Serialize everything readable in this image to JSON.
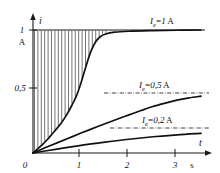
{
  "figure": {
    "name": "transient-current-curves",
    "background": "#ffffff",
    "ink_color": "#111111"
  },
  "axes": {
    "y": {
      "label": "i",
      "unit": "A",
      "ticks": [
        {
          "value": 1,
          "label": "1"
        },
        {
          "value": 0.5,
          "label": "0,5"
        }
      ],
      "origin_label": "0",
      "range": [
        0,
        1.12
      ]
    },
    "x": {
      "label": "t",
      "unit": "s",
      "ticks": [
        {
          "value": 1,
          "label": "1"
        },
        {
          "value": 2,
          "label": "2"
        },
        {
          "value": 3,
          "label": "3"
        }
      ],
      "range": [
        0,
        3.6
      ]
    }
  },
  "series_labels": {
    "top": {
      "symbol": "I",
      "subscript": "e",
      "equals": "=",
      "value": "1",
      "unit": "A"
    },
    "middle": {
      "symbol": "I",
      "subscript": "e",
      "equals": "=",
      "value": "0,5",
      "unit": "A"
    },
    "bottom": {
      "symbol": "I",
      "subscript": "e",
      "equals": "=",
      "value": "0,2",
      "unit": "A"
    }
  },
  "chart_data": {
    "type": "line",
    "title": "",
    "xlabel": "t",
    "ylabel": "i",
    "xunit": "s",
    "yunit": "A",
    "xlim": [
      0,
      3.6
    ],
    "ylim": [
      0,
      1.12
    ],
    "grid": false,
    "legend_position": "inline-right",
    "x_ticks": [
      1,
      2,
      3
    ],
    "y_ticks": [
      0.5,
      1
    ],
    "shading": {
      "style": "vertical-hatch",
      "description": "vertical hatching between the I_e = 1 A curve and the i = 1 A asymptote",
      "x_range": [
        0,
        1.55
      ],
      "upper_value": 1.0
    },
    "series": [
      {
        "name": "I_e = 1 A",
        "label": "Ie = 1 A",
        "asymptote": 1.0,
        "x": [
          0,
          0.1,
          0.2,
          0.3,
          0.4,
          0.5,
          0.6,
          0.7,
          0.8,
          0.9,
          1.0,
          1.1,
          1.2,
          1.3,
          1.4,
          1.5,
          1.7,
          2.0,
          2.5,
          3.0,
          3.5
        ],
        "y": [
          0,
          0.035,
          0.07,
          0.11,
          0.155,
          0.2,
          0.25,
          0.31,
          0.38,
          0.46,
          0.57,
          0.7,
          0.82,
          0.9,
          0.945,
          0.965,
          0.982,
          0.99,
          0.995,
          0.998,
          1.0
        ]
      },
      {
        "name": "I_e = 0,5 A",
        "label": "Ie = 0,5 A",
        "asymptote": 0.5,
        "x": [
          0,
          0.25,
          0.5,
          0.75,
          1.0,
          1.25,
          1.5,
          1.75,
          2.0,
          2.25,
          2.5,
          2.75,
          3.0,
          3.25,
          3.5
        ],
        "y": [
          0,
          0.042,
          0.082,
          0.122,
          0.162,
          0.2,
          0.238,
          0.275,
          0.31,
          0.345,
          0.378,
          0.405,
          0.43,
          0.448,
          0.462
        ]
      },
      {
        "name": "I_e = 0,2 A",
        "label": "Ie = 0,2 A",
        "asymptote": 0.2,
        "x": [
          0,
          0.5,
          1.0,
          1.5,
          2.0,
          2.5,
          3.0,
          3.5
        ],
        "y": [
          0,
          0.032,
          0.062,
          0.088,
          0.112,
          0.132,
          0.148,
          0.16
        ]
      }
    ],
    "asymptote_lines": [
      {
        "value": 1.0,
        "style": "solid-top-bound",
        "x_range": [
          0,
          3.55
        ]
      },
      {
        "value": 0.5,
        "style": "dash-dot",
        "x_range": [
          1.62,
          3.55
        ]
      },
      {
        "value": 0.2,
        "style": "dash-dot",
        "x_range": [
          1.72,
          3.55
        ]
      }
    ]
  }
}
